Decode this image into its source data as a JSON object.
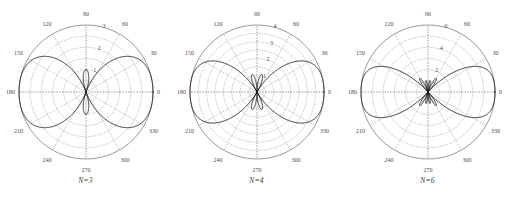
{
  "figure": {
    "background": "#ffffff",
    "curve_color": "#111111",
    "grid_color": "#777777"
  },
  "panels": [
    {
      "caption": "N=3",
      "angle_labels": [
        "0",
        "30",
        "60",
        "90",
        "120",
        "150",
        "180",
        "210",
        "240",
        "270",
        "300",
        "330"
      ],
      "radial_labels": [
        "1",
        "2",
        "3"
      ],
      "radial_values": [
        1,
        2,
        3
      ],
      "r_max": 3
    },
    {
      "caption": "N=4",
      "angle_labels": [
        "0",
        "30",
        "60",
        "90",
        "120",
        "150",
        "180",
        "210",
        "240",
        "270",
        "300",
        "330"
      ],
      "radial_labels": [
        "1",
        "2",
        "3",
        "4"
      ],
      "radial_values": [
        1,
        2,
        3,
        4
      ],
      "r_max": 4
    },
    {
      "caption": "N=6",
      "angle_labels": [
        "0",
        "30",
        "60",
        "90",
        "120",
        "150",
        "180",
        "210",
        "240",
        "270",
        "300",
        "330"
      ],
      "radial_labels": [
        "2",
        "4",
        "6"
      ],
      "radial_values": [
        2,
        4,
        6
      ],
      "r_max": 6
    }
  ],
  "chart_data": [
    {
      "type": "line",
      "title": "N=3",
      "plot_kind": "polar",
      "xlabel": "angle (degrees)",
      "ylabel": "magnitude",
      "grid": true,
      "legend": "none",
      "theta_ticks": [
        0,
        30,
        60,
        90,
        120,
        150,
        180,
        210,
        240,
        270,
        300,
        330
      ],
      "theta_tick_labels": [
        "0",
        "30",
        "60",
        "90",
        "120",
        "150",
        "180",
        "210",
        "240",
        "270",
        "300",
        "330"
      ],
      "r_ticks": [
        1,
        2,
        3
      ],
      "r_tick_labels": [
        "1",
        "2",
        "3"
      ],
      "rlim": [
        0,
        3
      ],
      "series": [
        {
          "name": "array factor N=3",
          "theta": [
            0,
            5,
            10,
            15,
            20,
            25,
            30,
            35,
            40,
            45,
            50,
            55,
            60,
            65,
            70,
            75,
            80,
            85,
            90,
            95,
            100,
            105,
            110,
            115,
            120,
            125,
            130,
            135,
            140,
            145,
            150,
            155,
            160,
            165,
            170,
            175,
            180,
            185,
            190,
            195,
            200,
            205,
            210,
            215,
            220,
            225,
            230,
            235,
            240,
            245,
            250,
            255,
            260,
            265,
            270,
            275,
            280,
            285,
            290,
            295,
            300,
            305,
            310,
            315,
            320,
            325,
            330,
            335,
            340,
            345,
            350,
            355,
            360
          ],
          "values": [
            3.0,
            2.99,
            2.96,
            2.9,
            2.83,
            2.73,
            2.6,
            2.46,
            2.3,
            2.12,
            1.93,
            1.72,
            1.5,
            1.27,
            1.03,
            0.78,
            0.52,
            0.26,
            0.9,
            0.26,
            0.52,
            0.78,
            1.03,
            1.27,
            1.5,
            1.72,
            1.93,
            2.12,
            2.3,
            2.46,
            2.6,
            2.73,
            2.83,
            2.9,
            2.96,
            2.99,
            3.0,
            2.99,
            2.96,
            2.9,
            2.83,
            2.73,
            2.6,
            2.46,
            2.3,
            2.12,
            1.93,
            1.72,
            1.5,
            1.27,
            1.03,
            0.78,
            0.52,
            0.26,
            0.9,
            0.26,
            0.52,
            0.78,
            1.03,
            1.27,
            1.5,
            1.72,
            1.93,
            2.12,
            2.3,
            2.46,
            2.6,
            2.73,
            2.83,
            2.9,
            2.96,
            2.99,
            3.0
          ]
        }
      ]
    },
    {
      "type": "line",
      "title": "N=4",
      "plot_kind": "polar",
      "xlabel": "angle (degrees)",
      "ylabel": "magnitude",
      "grid": true,
      "legend": "none",
      "theta_ticks": [
        0,
        30,
        60,
        90,
        120,
        150,
        180,
        210,
        240,
        270,
        300,
        330
      ],
      "theta_tick_labels": [
        "0",
        "30",
        "60",
        "90",
        "120",
        "150",
        "180",
        "210",
        "240",
        "270",
        "300",
        "330"
      ],
      "r_ticks": [
        1,
        2,
        3,
        4
      ],
      "r_tick_labels": [
        "1",
        "2",
        "3",
        "4"
      ],
      "rlim": [
        0,
        4
      ],
      "series": [
        {
          "name": "array factor N=4",
          "theta": [
            0,
            5,
            10,
            15,
            20,
            25,
            30,
            35,
            40,
            45,
            50,
            55,
            60,
            65,
            70,
            75,
            80,
            85,
            90,
            95,
            100,
            105,
            110,
            115,
            120,
            125,
            130,
            135,
            140,
            145,
            150,
            155,
            160,
            165,
            170,
            175,
            180,
            185,
            190,
            195,
            200,
            205,
            210,
            215,
            220,
            225,
            230,
            235,
            240,
            245,
            250,
            255,
            260,
            265,
            270,
            275,
            280,
            285,
            290,
            295,
            300,
            305,
            310,
            315,
            320,
            325,
            330,
            335,
            340,
            345,
            350,
            355,
            360
          ],
          "values": [
            4.0,
            3.98,
            3.93,
            3.84,
            3.72,
            3.56,
            3.38,
            3.16,
            2.92,
            2.66,
            2.38,
            2.08,
            1.78,
            1.47,
            1.16,
            0.86,
            0.57,
            0.28,
            1.0,
            0.28,
            0.57,
            0.86,
            1.16,
            1.47,
            1.78,
            2.08,
            2.38,
            2.66,
            2.92,
            3.16,
            3.38,
            3.56,
            3.72,
            3.84,
            3.93,
            3.98,
            4.0,
            3.98,
            3.93,
            3.84,
            3.72,
            3.56,
            3.38,
            3.16,
            2.92,
            2.66,
            2.38,
            2.08,
            1.78,
            1.47,
            1.16,
            0.86,
            0.57,
            0.28,
            1.0,
            0.28,
            0.57,
            0.86,
            1.16,
            1.47,
            1.78,
            2.08,
            2.38,
            2.66,
            2.92,
            3.16,
            3.38,
            3.56,
            3.72,
            3.84,
            3.93,
            3.98,
            4.0
          ]
        }
      ]
    },
    {
      "type": "line",
      "title": "N=6",
      "plot_kind": "polar",
      "xlabel": "angle (degrees)",
      "ylabel": "magnitude",
      "grid": true,
      "legend": "none",
      "theta_ticks": [
        0,
        30,
        60,
        90,
        120,
        150,
        180,
        210,
        240,
        270,
        300,
        330
      ],
      "theta_tick_labels": [
        "0",
        "30",
        "60",
        "90",
        "120",
        "150",
        "180",
        "210",
        "240",
        "270",
        "300",
        "330"
      ],
      "r_ticks": [
        2,
        4,
        6
      ],
      "r_tick_labels": [
        "2",
        "4",
        "6"
      ],
      "rlim": [
        0,
        6
      ],
      "series": [
        {
          "name": "array factor N=6",
          "theta": [
            0,
            5,
            10,
            15,
            20,
            25,
            30,
            35,
            40,
            45,
            50,
            55,
            60,
            65,
            70,
            75,
            80,
            85,
            90,
            95,
            100,
            105,
            110,
            115,
            120,
            125,
            130,
            135,
            140,
            145,
            150,
            155,
            160,
            165,
            170,
            175,
            180,
            185,
            190,
            195,
            200,
            205,
            210,
            215,
            220,
            225,
            230,
            235,
            240,
            245,
            250,
            255,
            260,
            265,
            270,
            275,
            280,
            285,
            290,
            295,
            300,
            305,
            310,
            315,
            320,
            325,
            330,
            335,
            340,
            345,
            350,
            355,
            360
          ],
          "values": [
            6.0,
            5.96,
            5.84,
            5.64,
            5.38,
            5.05,
            4.66,
            4.22,
            3.74,
            3.23,
            2.7,
            2.16,
            1.63,
            1.12,
            0.65,
            0.23,
            0.4,
            0.7,
            1.1,
            0.7,
            0.4,
            0.23,
            0.65,
            1.12,
            1.63,
            2.16,
            2.7,
            3.23,
            3.74,
            4.22,
            4.66,
            5.05,
            5.38,
            5.64,
            5.84,
            5.96,
            6.0,
            5.96,
            5.84,
            5.64,
            5.38,
            5.05,
            4.66,
            4.22,
            3.74,
            3.23,
            2.7,
            2.16,
            1.63,
            1.12,
            0.65,
            0.23,
            0.4,
            0.7,
            1.1,
            0.7,
            0.4,
            0.23,
            0.65,
            1.12,
            1.63,
            2.16,
            2.7,
            3.23,
            3.74,
            4.22,
            4.66,
            5.05,
            5.38,
            5.64,
            5.84,
            5.96,
            6.0
          ]
        }
      ]
    }
  ]
}
